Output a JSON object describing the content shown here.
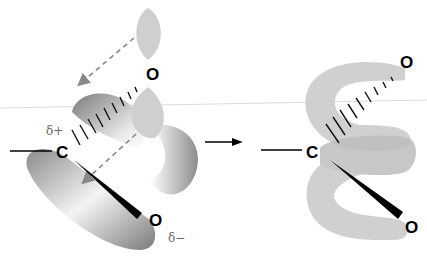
{
  "diagram": {
    "left": {
      "carbon_label": "C",
      "oxygen_top_label": "O",
      "oxygen_bottom_label": "O",
      "delta_plus": "δ+",
      "delta_minus": "δ−"
    },
    "right": {
      "carbon_label": "C",
      "oxygen_top_label": "O",
      "oxygen_bottom_label": "O"
    },
    "colors": {
      "orbital_gray": "#c8c8c8",
      "orbital_dark": "#8a8a8a",
      "bond": "#000000",
      "dashed_arrow": "#888888"
    }
  }
}
